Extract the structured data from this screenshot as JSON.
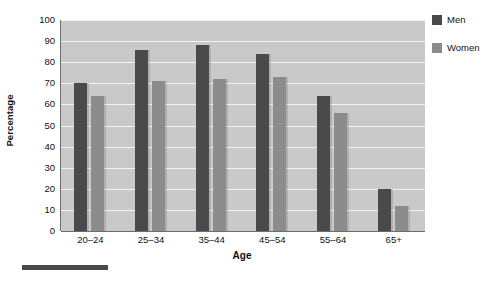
{
  "chart_data": {
    "type": "bar",
    "title": "",
    "xlabel": "Age",
    "ylabel": "Percentage",
    "categories": [
      "20–24",
      "25–34",
      "35–44",
      "45–54",
      "55–64",
      "65+"
    ],
    "series": [
      {
        "name": "Men",
        "color": "#4a4a4a",
        "values": [
          70,
          86,
          88,
          84,
          64,
          20
        ]
      },
      {
        "name": "Women",
        "color": "#8c8c8c",
        "values": [
          64,
          71,
          72,
          73,
          56,
          12
        ]
      }
    ],
    "ylim": [
      0,
      100
    ],
    "ytick_step": 10,
    "yticks": [
      100,
      90,
      80,
      70,
      60,
      50,
      40,
      30,
      20,
      10,
      0
    ],
    "grid": true,
    "grid_orientation": "horizontal",
    "legend_position": "right-top",
    "plot_background": "#c9c9c9",
    "gridline_color": "#f2f2f2",
    "axis_color": "#6d6d6d"
  },
  "legend": {
    "items": [
      {
        "label": "Men",
        "swatch_name": "legend-swatch-men",
        "color": "#4a4a4a"
      },
      {
        "label": "Women",
        "swatch_name": "legend-swatch-women",
        "color": "#8c8c8c"
      }
    ]
  },
  "axes": {
    "y_title": "Percentage",
    "x_title": "Age"
  }
}
